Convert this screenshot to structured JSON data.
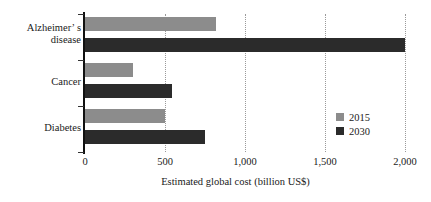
{
  "chart_data": {
    "type": "bar",
    "orientation": "horizontal",
    "title": "",
    "subtitle": "",
    "xlabel": "Estimated global cost (billion US$)",
    "ylabel": "",
    "categories": [
      "Alzheimer's\ndisease",
      "Cancer",
      "Diabetes"
    ],
    "series": [
      {
        "name": "2015",
        "color": "#8c8c8c",
        "values": [
          818,
          300,
          500
        ]
      },
      {
        "name": "2030",
        "color": "#2b2b2b",
        "values": [
          2000,
          545,
          750
        ]
      }
    ],
    "xlim": [
      0,
      2000
    ],
    "xticks": [
      0,
      500,
      1000,
      1500,
      2000
    ],
    "xticklabels": [
      "0",
      "500",
      "1,000",
      "1,500",
      "2,000"
    ],
    "grid": "vertical-dotted",
    "legend_position": "inside-lower-right",
    "legend_entries": [
      "2015",
      "2030"
    ]
  },
  "axis": {
    "x_title": "Estimated global cost (billion US$)"
  },
  "category_labels": {
    "alzheimer_line1": "Alzheimer’",
    "alzheimer_line2": "s",
    "alzheimer": "Alzheimer’ s\ndisease",
    "cancer": "Cancer",
    "diabetes": "Diabetes"
  },
  "ticks": {
    "t0": "0",
    "t500": "500",
    "t1000": "1,000",
    "t1500": "1,500",
    "t2000": "2,000"
  },
  "legend": {
    "item_2015": "2015",
    "item_2030": "2030"
  }
}
